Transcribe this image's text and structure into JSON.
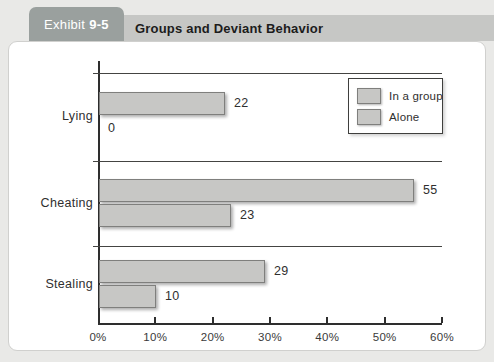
{
  "header": {
    "tab_prefix": "Exhibit",
    "tab_number": "9-5",
    "title": "Groups and Deviant Behavior",
    "tab_color": "#9aa09e",
    "bar_color": "#c6c7c5"
  },
  "chart_data": {
    "type": "bar",
    "orientation": "horizontal",
    "title": "Groups and Deviant Behavior",
    "categories": [
      "Lying",
      "Cheating",
      "Stealing"
    ],
    "series": [
      {
        "name": "In a group",
        "values": [
          22,
          55,
          29
        ]
      },
      {
        "name": "Alone",
        "values": [
          0,
          23,
          10
        ]
      }
    ],
    "x_ticks": [
      "0%",
      "10%",
      "20%",
      "30%",
      "40%",
      "50%",
      "60%"
    ],
    "xlim": [
      0,
      60
    ],
    "value_labels_shown": true,
    "legend_position": "top-right",
    "grid": "category-separator-lines",
    "bar_fill": "#c7c7c5",
    "bar_border": "#7f7f7d"
  }
}
